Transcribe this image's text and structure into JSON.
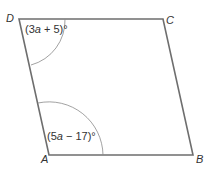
{
  "diagram": {
    "type": "parallelogram",
    "colors": {
      "edge": "#6e6e6e",
      "arc": "#8a8a8a",
      "text": "#333333",
      "background": "#ffffff"
    },
    "vertices": {
      "A": {
        "label": "A",
        "x": 49,
        "y": 155
      },
      "B": {
        "label": "B",
        "x": 193,
        "y": 155
      },
      "C": {
        "label": "C",
        "x": 163,
        "y": 19
      },
      "D": {
        "label": "D",
        "x": 19,
        "y": 19
      }
    },
    "angles": {
      "D": {
        "prefix": "(3",
        "var": "a",
        "suffix": " + 5)°",
        "full": "(3a + 5)°"
      },
      "A": {
        "prefix": "(5",
        "var": "a",
        "suffix": " − 17)°",
        "full": "(5a − 17)°"
      }
    }
  }
}
